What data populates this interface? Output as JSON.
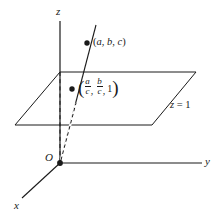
{
  "figure": {
    "type": "3d-coordinate-diagram",
    "background_color": "#ffffff",
    "stroke_color": "#1a1a1a",
    "axes": {
      "z_label": "z",
      "y_label": "y",
      "x_label": "x",
      "origin_label": "O"
    },
    "plane": {
      "label_z": "z",
      "label_eq": " = 1",
      "label_full": "z = 1"
    },
    "points": [
      {
        "name": "point-abc",
        "label_open": "(",
        "label_a": "a",
        "label_comma1": ", ",
        "label_b": "b",
        "label_comma2": ", ",
        "label_c": "c",
        "label_close": ")",
        "label_full": "(a, b, c)",
        "x": 87,
        "y": 43
      },
      {
        "name": "point-projection",
        "label_full": "(a/c, b/c, 1)",
        "num_a": "a",
        "den_c1": "c",
        "num_b": "b",
        "den_c2": "c",
        "third": "1",
        "comma": ",",
        "x": 72,
        "y": 89
      }
    ]
  }
}
